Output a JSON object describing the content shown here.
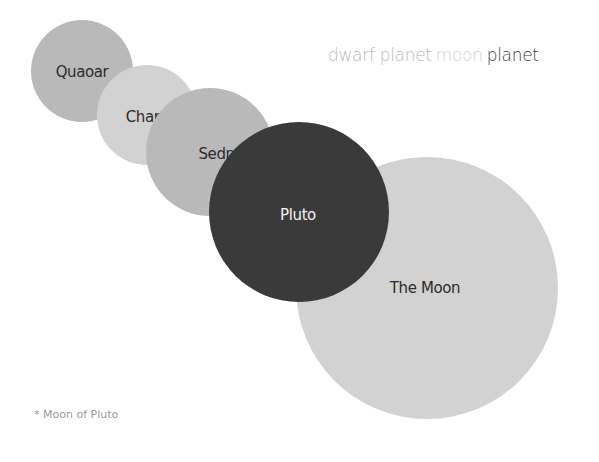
{
  "chart_data": {
    "type": "bubble",
    "title": "",
    "legend": [
      {
        "label": "dwarf planet",
        "color": "#b9b9b9"
      },
      {
        "label": "moon",
        "color": "#d2d2d2"
      },
      {
        "label": "planet",
        "color": "#3a3a3a"
      }
    ],
    "legend_position": "top-right",
    "bubbles": [
      {
        "label": "Quaoar",
        "category": "dwarf planet",
        "cx": 82,
        "cy": 71,
        "r": 51,
        "color": "#b9b9b9",
        "text_color": "#2b2b2b",
        "label_x": 82,
        "label_y": 77
      },
      {
        "label": "Charon*",
        "category": "moon",
        "cx": 147,
        "cy": 115,
        "r": 50,
        "color": "#d2d2d2",
        "text_color": "#2b2b2b",
        "label_x": 155,
        "label_y": 122
      },
      {
        "label": "Sedna",
        "category": "dwarf planet",
        "cx": 210,
        "cy": 152,
        "r": 64,
        "color": "#b9b9b9",
        "text_color": "#2b2b2b",
        "label_x": 221,
        "label_y": 159
      },
      {
        "label": "The Moon",
        "category": "moon",
        "cx": 427,
        "cy": 288,
        "r": 131,
        "color": "#d2d2d2",
        "text_color": "#2b2b2b",
        "label_x": 425,
        "label_y": 293
      },
      {
        "label": "Pluto",
        "category": "planet",
        "cx": 299,
        "cy": 212,
        "r": 90,
        "color": "#3a3a3a",
        "text_color": "#f2f2f2",
        "label_x": 298,
        "label_y": 220
      }
    ],
    "annotations": [
      "* Moon of Pluto"
    ],
    "xlabel": "",
    "ylabel": "",
    "grid": false
  },
  "legend": {
    "dwarf_planet": "dwarf planet",
    "moon": "moon",
    "planet": "planet"
  },
  "footnote": "* Moon of Pluto"
}
